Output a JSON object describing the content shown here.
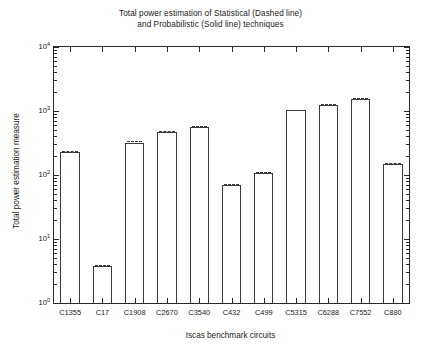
{
  "chart_data": {
    "type": "bar",
    "title": "Total power estimation of Statistical (Dashed line) and Probabilistic (Solid line) techniques",
    "title_line1": "Total power estimation of Statistical (Dashed line)",
    "title_line2": "and Probabilistic (Solid line) techniques",
    "xlabel": "Iscas benchmark circuits",
    "ylabel": "Total power estimation measure",
    "yscale": "log",
    "ylim": [
      1,
      10000
    ],
    "grid": false,
    "legend_position": "none",
    "ytick_labels": [
      "10",
      "10",
      "10",
      "10",
      "10"
    ],
    "ytick_exponents": [
      "0",
      "1",
      "2",
      "3",
      "4"
    ],
    "ytick_values": [
      1,
      10,
      100,
      1000,
      10000
    ],
    "categories": [
      "C1355",
      "C17",
      "C1908",
      "C2670",
      "C3540",
      "C432",
      "C499",
      "C5315",
      "C6288",
      "C7552",
      "C880"
    ],
    "series": [
      {
        "name": "Probabilistic (Solid line)",
        "style": "solid",
        "values": [
          228,
          3.8,
          320,
          465,
          565,
          71,
          108,
          1020,
          1240,
          1520,
          150
        ]
      },
      {
        "name": "Statistical (Dashed line)",
        "style": "dashed",
        "values": [
          240,
          3.9,
          335,
          480,
          580,
          73,
          112,
          1050,
          1300,
          1580,
          155
        ]
      }
    ]
  }
}
